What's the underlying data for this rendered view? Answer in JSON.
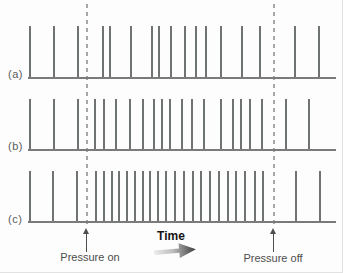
{
  "figure": {
    "plot_left_px": 28,
    "plot_width_px": 308,
    "rows": [
      {
        "label": "(a)",
        "top_px": 26,
        "height_px": 51,
        "spike_x_px": [
          29,
          53,
          77,
          102,
          109,
          130,
          151,
          158,
          170,
          184,
          195,
          205,
          220,
          241,
          259,
          294,
          318
        ]
      },
      {
        "label": "(b)",
        "top_px": 99,
        "height_px": 50,
        "spike_x_px": [
          29,
          53,
          77,
          94,
          103,
          115,
          129,
          142,
          153,
          161,
          169,
          181,
          191,
          203,
          220,
          232,
          240,
          249,
          261,
          285,
          308
        ]
      },
      {
        "label": "(c)",
        "top_px": 171,
        "height_px": 50,
        "spike_x_px": [
          29,
          52,
          76,
          95,
          103,
          111,
          118,
          126,
          134,
          142,
          149,
          157,
          165,
          174,
          183,
          192,
          200,
          209,
          218,
          227,
          235,
          244,
          254,
          262,
          295,
          319
        ]
      }
    ],
    "markers": {
      "pressure_on_label": "Pressure on",
      "pressure_off_label": "Pressure off",
      "time_label": "Time",
      "pressure_on_x_px": 86,
      "pressure_off_x_px": 273
    },
    "colors": {
      "bg": "#fdfdfd",
      "spike": "#6f7473",
      "baseline": "#7a7a7a",
      "dash": "#a3a8a8",
      "label": "#5c5c5c",
      "text": "#4d4d4d",
      "arrow": "#4d4d4d",
      "time-text": "#141414"
    }
  },
  "chart_data": {
    "type": "scatter",
    "subtype": "event-raster",
    "title": "",
    "xlabel": "Time",
    "ylabel": "",
    "annotations": [
      "Pressure on",
      "Pressure off"
    ],
    "series": [
      {
        "name": "(a)",
        "event_times": [
          29,
          53,
          77,
          102,
          109,
          130,
          151,
          158,
          170,
          184,
          195,
          205,
          220,
          241,
          259,
          294,
          318
        ]
      },
      {
        "name": "(b)",
        "event_times": [
          29,
          53,
          77,
          94,
          103,
          115,
          129,
          142,
          153,
          161,
          169,
          181,
          191,
          203,
          220,
          232,
          240,
          249,
          261,
          285,
          308
        ]
      },
      {
        "name": "(c)",
        "event_times": [
          29,
          52,
          76,
          95,
          103,
          111,
          118,
          126,
          134,
          142,
          149,
          157,
          165,
          174,
          183,
          192,
          200,
          209,
          218,
          227,
          235,
          244,
          254,
          262,
          295,
          319
        ]
      }
    ],
    "x_events": {
      "pressure_on": 86,
      "pressure_off": 273
    },
    "xlim": [
      0,
      343
    ]
  }
}
